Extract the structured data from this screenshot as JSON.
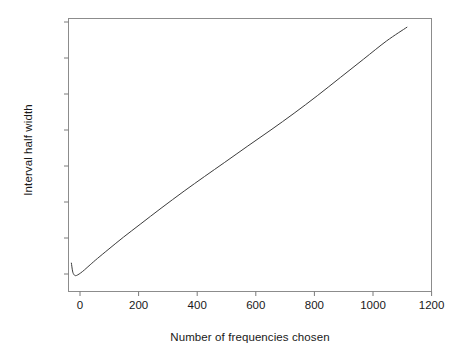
{
  "chart_data": {
    "type": "line",
    "title": "",
    "subtitle": "",
    "xlabel": "Number of frequencies chosen",
    "ylabel": "Interval half width",
    "xlim": [
      0,
      1255
    ],
    "ylim": [
      0,
      1
    ],
    "grid": false,
    "legend": null,
    "xticks": [
      0,
      200,
      400,
      600,
      800,
      1000,
      1200
    ],
    "xtick_labels": [
      "0",
      "200",
      "400",
      "600",
      "800",
      "1000",
      "1200"
    ],
    "yticks": [
      0.07,
      0.2,
      0.33,
      0.46,
      0.6,
      0.73,
      0.86,
      0.99
    ],
    "ytick_labels": [
      "",
      "",
      "",
      "",
      "",
      "",
      "",
      ""
    ],
    "series": [
      {
        "name": "interval half width",
        "color": "#3c3c3c",
        "linewidth": 1,
        "x": [
          10,
          14,
          18,
          24,
          32,
          42,
          55,
          75,
          100,
          140,
          190,
          250,
          320,
          400,
          470,
          540,
          620,
          700,
          780,
          860,
          940,
          1020,
          1100,
          1170
        ],
        "y": [
          0.104,
          0.075,
          0.063,
          0.058,
          0.061,
          0.068,
          0.079,
          0.098,
          0.121,
          0.156,
          0.199,
          0.248,
          0.305,
          0.368,
          0.421,
          0.473,
          0.533,
          0.592,
          0.653,
          0.717,
          0.784,
          0.851,
          0.918,
          0.968
        ]
      }
    ],
    "annotations": []
  },
  "axis": {
    "frame_color": "#8c8c8c",
    "tick_color": "#7a7a7a"
  },
  "xtick_positions_px": [
    80,
    138.6,
    197.2,
    255.8,
    314.4,
    373,
    431.6
  ],
  "ytick_positions_px": [
    274,
    238,
    202,
    166,
    130,
    94,
    58,
    22
  ]
}
